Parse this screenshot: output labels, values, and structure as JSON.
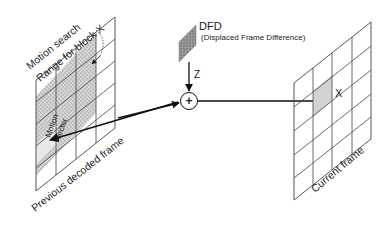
{
  "diagram": {
    "left_frame": {
      "label": "Previous decoded frame",
      "search_label_line1": "Motion search",
      "search_label_line2": "Range for block X",
      "motion_vector_line1": "Motion",
      "motion_vector_line2": "vector"
    },
    "dfd": {
      "label": "DFD",
      "sublabel": "(Displaced Frame Difference)",
      "arrow_label": "Z"
    },
    "adder": {
      "symbol": "+"
    },
    "right_frame": {
      "label": "Current frame",
      "block_label": "X"
    },
    "colors": {
      "line": "#333333",
      "search_fill": "#c8c8c8",
      "block_fill": "#d0d0d0",
      "dfd_fill": "#8a8a8a"
    }
  }
}
